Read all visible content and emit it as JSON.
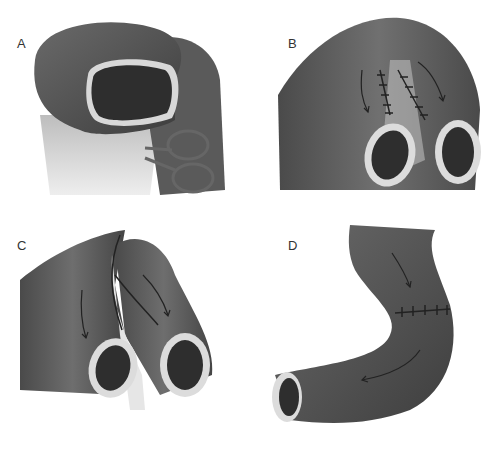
{
  "figure": {
    "panels": [
      {
        "id": "A",
        "label": "A",
        "description": "Bowel end with lumen, clamp on mesentery"
      },
      {
        "id": "B",
        "label": "B",
        "description": "Two limbs sutured side-by-side, arrows showing direction"
      },
      {
        "id": "C",
        "label": "C",
        "description": "Limbs divided with running suture line, arrows"
      },
      {
        "id": "D",
        "label": "D",
        "description": "Reconstructed curved bowel with transverse suture line and arrows"
      }
    ],
    "colors": {
      "tissue": "#5e5e5e",
      "tissue_dark": "#3a3a3a",
      "lumen": "#2e2e2e",
      "rim": "#d8d8d8",
      "mesentery": "#d2d2d2",
      "suture": "#222222"
    }
  }
}
